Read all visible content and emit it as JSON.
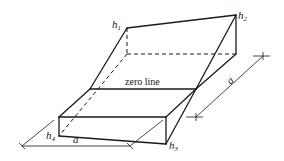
{
  "diagram": {
    "labels": {
      "h1": "h",
      "h1_sub": "1",
      "h2": "h",
      "h2_sub": "2",
      "h3": "h",
      "h3_sub": "3",
      "h4": "h",
      "h4_sub": "4",
      "zero_line": "zero line",
      "dim_bottom": "a",
      "dim_right": "a"
    },
    "colors": {
      "stroke": "#1a1a1a",
      "background": "#ffffff"
    }
  }
}
